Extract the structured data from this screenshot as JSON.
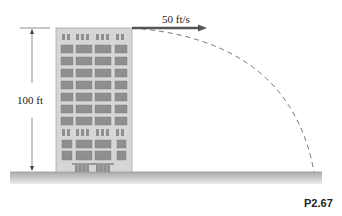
{
  "diagram": {
    "velocity_label": "50 ft/s",
    "height_label": "100 ft",
    "figure_label": "P2.67",
    "colors": {
      "building": "#d6d6d6",
      "building_edge": "#a8a8a8",
      "window": "#8f8f8f",
      "ground": "#bdbdbd",
      "arrow": "#555555",
      "trajectory": "#666666"
    }
  }
}
